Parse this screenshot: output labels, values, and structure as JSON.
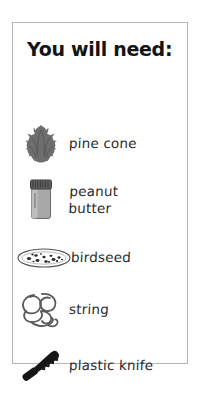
{
  "card": {
    "title": "You will need:",
    "border_color": "#b4b4b4",
    "background_color": "#ffffff",
    "text_color": "#2b2b2b",
    "title_color": "#141414"
  },
  "materials": [
    {
      "label": "pine cone",
      "icon": "pine-cone-icon",
      "icon_color": "#6e6e6e"
    },
    {
      "label": "peanut\nbutter",
      "icon": "peanut-butter-jar-icon",
      "icon_color": "#8a8a8a"
    },
    {
      "label": "birdseed",
      "icon": "birdseed-dish-icon",
      "icon_color": "#4a4a4a"
    },
    {
      "label": "string",
      "icon": "string-tangle-icon",
      "icon_color": "#5a5a5a"
    },
    {
      "label": "plastic knife",
      "icon": "plastic-knife-icon",
      "icon_color": "#1a1a1a"
    }
  ]
}
